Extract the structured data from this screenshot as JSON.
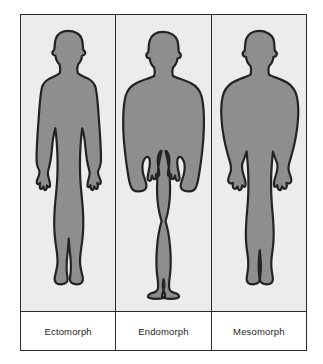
{
  "figure": {
    "type": "somatotype-comparison-diagram",
    "panel_count": 3,
    "colors": {
      "page_background": "#ffffff",
      "panel_background": "#ececec",
      "silhouette_fill": "#8e8e8e",
      "outline": "#222222",
      "frame_border": "#2b2b2b",
      "label_background": "#ffffff",
      "label_text": "#1d1d1d"
    },
    "panels": [
      {
        "label": "Ectomorph",
        "silhouette_name": "ectomorph-silhouette",
        "build": "slender, narrow shoulders, thin limbs, arms separated from torso"
      },
      {
        "label": "Endomorph",
        "silhouette_name": "endomorph-silhouette",
        "build": "round, wide heavy torso, arms held against the body with narrow gaps"
      },
      {
        "label": "Mesomorph",
        "silhouette_name": "mesomorph-silhouette",
        "build": "muscular, broad shoulders, tapered waist, thick arms and legs"
      }
    ]
  }
}
